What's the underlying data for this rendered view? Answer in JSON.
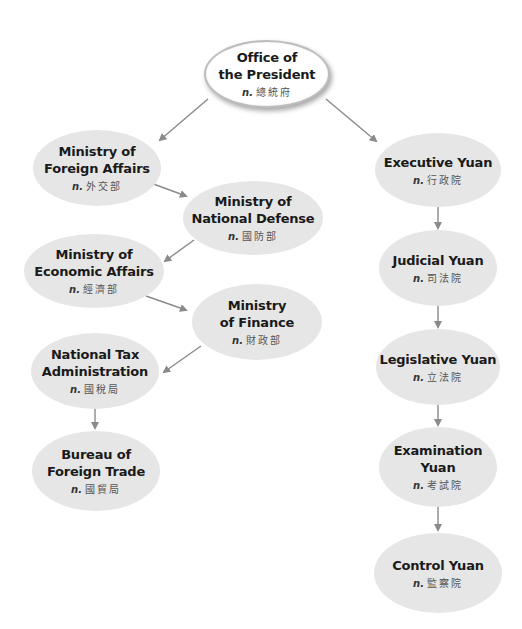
{
  "diagram": {
    "type": "organizational-chart",
    "colors": {
      "node_fill": "#e6e6e6",
      "root_fill": "#ffffff",
      "root_border": "#bdbdbd",
      "arrow": "#8a8a8a",
      "text": "#1a1a1a",
      "chinese_text": "#555555"
    },
    "pos_label": "n.",
    "nodes": {
      "president": {
        "en": "Office of\nthe President",
        "zh": "總統府"
      },
      "foreign_affairs": {
        "en": "Ministry of\nForeign Affairs",
        "zh": "外交部"
      },
      "national_defense": {
        "en": "Ministry of\nNational Defense",
        "zh": "國防部"
      },
      "economic_affairs": {
        "en": "Ministry of\nEconomic Affairs",
        "zh": "經濟部"
      },
      "finance": {
        "en": "Ministry\nof Finance",
        "zh": "財政部"
      },
      "national_tax": {
        "en": "National Tax\nAdministration",
        "zh": "國稅局"
      },
      "foreign_trade": {
        "en": "Bureau of\nForeign Trade",
        "zh": "國貿局"
      },
      "executive_yuan": {
        "en": "Executive Yuan",
        "zh": "行政院"
      },
      "judicial_yuan": {
        "en": "Judicial Yuan",
        "zh": "司法院"
      },
      "legislative_yuan": {
        "en": "Legislative Yuan",
        "zh": "立法院"
      },
      "examination_yuan": {
        "en": "Examination\nYuan",
        "zh": "考試院"
      },
      "control_yuan": {
        "en": "Control Yuan",
        "zh": "監察院"
      }
    },
    "edges": [
      {
        "from": "president",
        "to": "foreign_affairs"
      },
      {
        "from": "president",
        "to": "executive_yuan"
      },
      {
        "from": "foreign_affairs",
        "to": "national_defense"
      },
      {
        "from": "national_defense",
        "to": "economic_affairs"
      },
      {
        "from": "economic_affairs",
        "to": "finance"
      },
      {
        "from": "finance",
        "to": "national_tax"
      },
      {
        "from": "national_tax",
        "to": "foreign_trade"
      },
      {
        "from": "executive_yuan",
        "to": "judicial_yuan"
      },
      {
        "from": "judicial_yuan",
        "to": "legislative_yuan"
      },
      {
        "from": "legislative_yuan",
        "to": "examination_yuan"
      },
      {
        "from": "examination_yuan",
        "to": "control_yuan"
      }
    ]
  }
}
